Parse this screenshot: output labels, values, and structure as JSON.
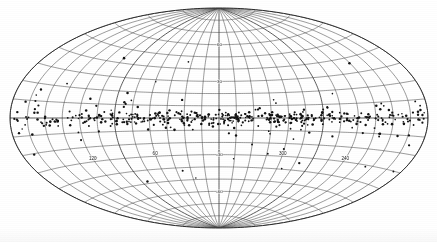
{
  "figure": {
    "projection": "Aitoff",
    "coordinate_system": "galactic",
    "background_color": "#ffffff",
    "grid_color": "#4a4a4a",
    "point_color": "#121212"
  },
  "chart_data": {
    "type": "scatter",
    "title": "",
    "subtitle": "",
    "xlabel": "",
    "ylabel": "",
    "projection": "aitoff",
    "coordinate_system": "galactic",
    "xlim": [
      180,
      -180
    ],
    "ylim": [
      -90,
      90
    ],
    "grid": true,
    "legend": null,
    "annotations": [],
    "axes": {
      "longitude": {
        "name": "galactic longitude l",
        "unit": "degrees",
        "range": [
          0,
          360
        ],
        "tick_step": 15,
        "labeled_ticks": [
          {
            "value": 120,
            "label": "120"
          },
          {
            "value": 60,
            "label": "60"
          },
          {
            "value": 0,
            "label": "0"
          },
          {
            "value": 300,
            "label": "300"
          },
          {
            "value": 240,
            "label": "240"
          }
        ]
      },
      "latitude": {
        "name": "galactic latitude b",
        "unit": "degrees",
        "range": [
          -90,
          90
        ],
        "tick_step": 10,
        "labeled_ticks": [
          {
            "value": 60,
            "label": "60"
          },
          {
            "value": 30,
            "label": "30"
          },
          {
            "value": -30,
            "label": "-30"
          },
          {
            "value": -60,
            "label": "-60"
          }
        ]
      }
    },
    "series": [
      {
        "name": "sources",
        "marker": "filled-circle",
        "marker_size_px": 1.9,
        "color": "#121212",
        "point_count": 512,
        "description": "Point sources strongly concentrated toward the galactic plane (b = 0), with a broad low-latitude scatter extending to |b| ~ 40 degrees and a few isolated high-latitude objects.",
        "distribution": {
          "longitude": "approximately uniform across 0-360 degrees with dense clumps near l = 30-90, l = 250-340 and l = 0",
          "latitude": "sharply peaked at b = 0, exponential falloff with scale height of about 5 degrees, plus a sparse halo component"
        }
      }
    ]
  },
  "labels": {
    "lon": [
      "120",
      "60",
      "0",
      "300",
      "240"
    ],
    "lat_north": [
      "60",
      "30"
    ],
    "lat_south": [
      "-30",
      "-60"
    ]
  }
}
